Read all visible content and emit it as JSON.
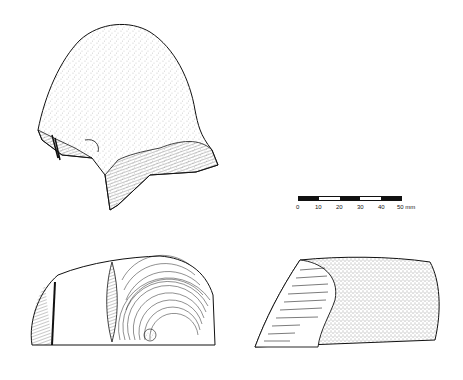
{
  "figure": {
    "type": "archaeological lithic illustration",
    "views": [
      {
        "id": "top-view",
        "description": "dorsal view of stone core with cortex stippling and flake scars at base"
      },
      {
        "id": "bottom-left-view",
        "description": "lateral view showing concentric ripple flake scars"
      },
      {
        "id": "bottom-right-view",
        "description": "lateral view with cortex stippling and flake scars at left end"
      }
    ]
  },
  "scale_bar": {
    "labels": [
      "0",
      "10",
      "20",
      "30",
      "40",
      "50 mm"
    ],
    "unit": "mm",
    "segments": [
      "dark",
      "light",
      "dark",
      "light",
      "dark"
    ]
  },
  "colors": {
    "ink": "#111111",
    "paper": "#ffffff"
  }
}
